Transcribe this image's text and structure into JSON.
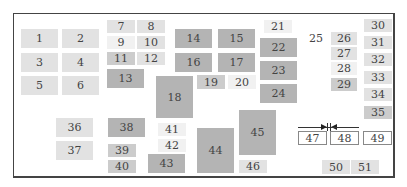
{
  "diagram": {
    "type": "numbered-block-layout",
    "blocks": [
      {
        "id": "1",
        "label": "1",
        "x": 21,
        "y": 29,
        "w": 37,
        "h": 19,
        "shade": 2
      },
      {
        "id": "2",
        "label": "2",
        "x": 62,
        "y": 29,
        "w": 37,
        "h": 19,
        "shade": 2
      },
      {
        "id": "3",
        "label": "3",
        "x": 21,
        "y": 53,
        "w": 37,
        "h": 19,
        "shade": 2
      },
      {
        "id": "4",
        "label": "4",
        "x": 62,
        "y": 53,
        "w": 37,
        "h": 19,
        "shade": 2
      },
      {
        "id": "5",
        "label": "5",
        "x": 21,
        "y": 76,
        "w": 37,
        "h": 19,
        "shade": 2
      },
      {
        "id": "6",
        "label": "6",
        "x": 62,
        "y": 76,
        "w": 37,
        "h": 19,
        "shade": 2
      },
      {
        "id": "7",
        "label": "7",
        "x": 107,
        "y": 20,
        "w": 28,
        "h": 13,
        "shade": 2
      },
      {
        "id": "8",
        "label": "8",
        "x": 137,
        "y": 20,
        "w": 28,
        "h": 13,
        "shade": 2
      },
      {
        "id": "9",
        "label": "9",
        "x": 107,
        "y": 36,
        "w": 28,
        "h": 13,
        "shade": 1
      },
      {
        "id": "10",
        "label": "10",
        "x": 137,
        "y": 36,
        "w": 28,
        "h": 13,
        "shade": 2
      },
      {
        "id": "11",
        "label": "11",
        "x": 107,
        "y": 52,
        "w": 28,
        "h": 13,
        "shade": 3
      },
      {
        "id": "12",
        "label": "12",
        "x": 137,
        "y": 52,
        "w": 28,
        "h": 13,
        "shade": 2
      },
      {
        "id": "13",
        "label": "13",
        "x": 107,
        "y": 69,
        "w": 37,
        "h": 19,
        "shade": 4
      },
      {
        "id": "14",
        "label": "14",
        "x": 175,
        "y": 29,
        "w": 37,
        "h": 19,
        "shade": 4
      },
      {
        "id": "15",
        "label": "15",
        "x": 218,
        "y": 29,
        "w": 37,
        "h": 19,
        "shade": 4
      },
      {
        "id": "16",
        "label": "16",
        "x": 175,
        "y": 53,
        "w": 37,
        "h": 19,
        "shade": 4
      },
      {
        "id": "17",
        "label": "17",
        "x": 218,
        "y": 53,
        "w": 37,
        "h": 19,
        "shade": 4
      },
      {
        "id": "18",
        "label": "18",
        "x": 156,
        "y": 76,
        "w": 37,
        "h": 42,
        "shade": 4
      },
      {
        "id": "19",
        "label": "19",
        "x": 197,
        "y": 75,
        "w": 28,
        "h": 14,
        "shade": 3
      },
      {
        "id": "20",
        "label": "20",
        "x": 228,
        "y": 75,
        "w": 28,
        "h": 14,
        "shade": 1
      },
      {
        "id": "21",
        "label": "21",
        "x": 264,
        "y": 20,
        "w": 28,
        "h": 13,
        "shade": 1
      },
      {
        "id": "22",
        "label": "22",
        "x": 260,
        "y": 38,
        "w": 37,
        "h": 19,
        "shade": 4
      },
      {
        "id": "23",
        "label": "23",
        "x": 260,
        "y": 61,
        "w": 37,
        "h": 19,
        "shade": 4
      },
      {
        "id": "24",
        "label": "24",
        "x": 260,
        "y": 84,
        "w": 37,
        "h": 19,
        "shade": 4
      },
      {
        "id": "25",
        "label": "25",
        "x": 303,
        "y": 32,
        "w": 26,
        "h": 13,
        "shade": 0
      },
      {
        "id": "26",
        "label": "26",
        "x": 331,
        "y": 32,
        "w": 26,
        "h": 13,
        "shade": 2
      },
      {
        "id": "27",
        "label": "27",
        "x": 331,
        "y": 47,
        "w": 26,
        "h": 13,
        "shade": 2
      },
      {
        "id": "28",
        "label": "28",
        "x": 331,
        "y": 62,
        "w": 26,
        "h": 13,
        "shade": 1
      },
      {
        "id": "29",
        "label": "29",
        "x": 331,
        "y": 78,
        "w": 26,
        "h": 13,
        "shade": 3
      },
      {
        "id": "30",
        "label": "30",
        "x": 364,
        "y": 19,
        "w": 28,
        "h": 13,
        "shade": 2
      },
      {
        "id": "31",
        "label": "31",
        "x": 364,
        "y": 36,
        "w": 28,
        "h": 13,
        "shade": 2
      },
      {
        "id": "32",
        "label": "32",
        "x": 364,
        "y": 53,
        "w": 28,
        "h": 13,
        "shade": 2
      },
      {
        "id": "33",
        "label": "33",
        "x": 364,
        "y": 71,
        "w": 28,
        "h": 13,
        "shade": 2
      },
      {
        "id": "34",
        "label": "34",
        "x": 364,
        "y": 88,
        "w": 28,
        "h": 13,
        "shade": 2
      },
      {
        "id": "35",
        "label": "35",
        "x": 364,
        "y": 106,
        "w": 28,
        "h": 13,
        "shade": 3
      },
      {
        "id": "36",
        "label": "36",
        "x": 56,
        "y": 118,
        "w": 37,
        "h": 19,
        "shade": 2
      },
      {
        "id": "37",
        "label": "37",
        "x": 56,
        "y": 141,
        "w": 37,
        "h": 19,
        "shade": 2
      },
      {
        "id": "38",
        "label": "38",
        "x": 108,
        "y": 118,
        "w": 37,
        "h": 19,
        "shade": 4
      },
      {
        "id": "39",
        "label": "39",
        "x": 108,
        "y": 144,
        "w": 28,
        "h": 13,
        "shade": 3
      },
      {
        "id": "40",
        "label": "40",
        "x": 108,
        "y": 160,
        "w": 28,
        "h": 13,
        "shade": 3
      },
      {
        "id": "41",
        "label": "41",
        "x": 158,
        "y": 123,
        "w": 28,
        "h": 13,
        "shade": 1
      },
      {
        "id": "42",
        "label": "42",
        "x": 158,
        "y": 139,
        "w": 28,
        "h": 13,
        "shade": 1
      },
      {
        "id": "43",
        "label": "43",
        "x": 148,
        "y": 154,
        "w": 37,
        "h": 19,
        "shade": 4
      },
      {
        "id": "44",
        "label": "44",
        "x": 197,
        "y": 128,
        "w": 37,
        "h": 45,
        "shade": 4
      },
      {
        "id": "45",
        "label": "45",
        "x": 239,
        "y": 110,
        "w": 37,
        "h": 45,
        "shade": 4
      },
      {
        "id": "46",
        "label": "46",
        "x": 239,
        "y": 160,
        "w": 28,
        "h": 13,
        "shade": 2
      },
      {
        "id": "47",
        "label": "47",
        "x": 298,
        "y": 131,
        "w": 29,
        "h": 14,
        "shade": "outline"
      },
      {
        "id": "48",
        "label": "48",
        "x": 330,
        "y": 131,
        "w": 29,
        "h": 14,
        "shade": "outline"
      },
      {
        "id": "49",
        "label": "49",
        "x": 363,
        "y": 131,
        "w": 29,
        "h": 14,
        "shade": "outline"
      },
      {
        "id": "50",
        "label": "50",
        "x": 322,
        "y": 160,
        "w": 28,
        "h": 14,
        "shade": 2
      },
      {
        "id": "51",
        "label": "51",
        "x": 351,
        "y": 160,
        "w": 28,
        "h": 14,
        "shade": 2
      }
    ],
    "dimension_marker": {
      "between": [
        "47",
        "48"
      ],
      "y": 127
    }
  }
}
